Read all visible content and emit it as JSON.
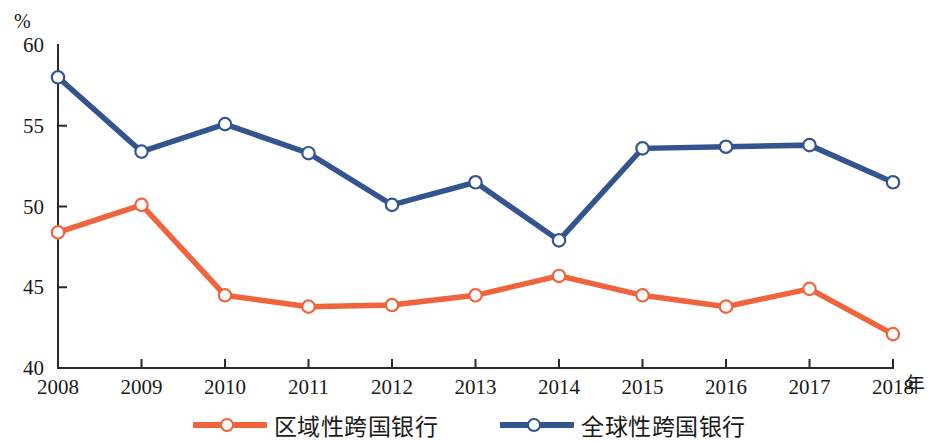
{
  "chart_data": {
    "type": "line",
    "title": "",
    "xlabel": "年",
    "ylabel": "%",
    "x": [
      "2008",
      "2009",
      "2010",
      "2011",
      "2012",
      "2013",
      "2014",
      "2015",
      "2016",
      "2017",
      "2018"
    ],
    "categories": [
      "2008",
      "2009",
      "2010",
      "2011",
      "2012",
      "2013",
      "2014",
      "2015",
      "2016",
      "2017",
      "2018"
    ],
    "ylim": [
      40,
      60
    ],
    "yticks": [
      "40",
      "45",
      "50",
      "55",
      "60"
    ],
    "ytick_values": [
      40,
      45,
      50,
      55,
      60
    ],
    "grid": false,
    "legend_position": "bottom",
    "series": [
      {
        "name": "区域性跨国银行",
        "color": "#F0643C",
        "marker": "circle-open",
        "values": [
          48.4,
          50.1,
          44.5,
          43.8,
          43.9,
          44.5,
          45.7,
          44.5,
          43.8,
          44.9,
          42.1
        ]
      },
      {
        "name": "全球性跨国银行",
        "color": "#34548F",
        "marker": "circle-open",
        "values": [
          58.0,
          53.4,
          55.1,
          53.3,
          50.1,
          51.5,
          47.9,
          53.6,
          53.7,
          53.8,
          51.5
        ]
      }
    ]
  },
  "legend": {
    "items": [
      {
        "label": "区域性跨国银行",
        "color": "#F0643C"
      },
      {
        "label": "全球性跨国银行",
        "color": "#34548F"
      }
    ]
  },
  "axes": {
    "y_unit": "%",
    "x_unit": "年"
  }
}
